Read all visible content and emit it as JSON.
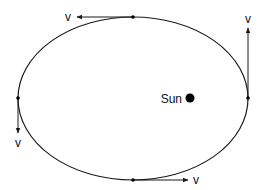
{
  "diagram": {
    "colors": {
      "stroke": "#1a1a1a",
      "background": "#ffffff",
      "sun": "#000000"
    },
    "orbit": {
      "cx": 133,
      "cy": 98.5,
      "rx": 115,
      "ry": 81.5
    },
    "sun": {
      "label": "Sun",
      "x": 190,
      "y": 98,
      "r": 4.5
    },
    "points": [
      {
        "name": "top",
        "x": 133,
        "y": 17,
        "arrow_to": [
          77,
          17
        ],
        "label": "v",
        "label_x": 68,
        "label_y": 21
      },
      {
        "name": "right",
        "x": 248,
        "y": 98,
        "arrow_to": [
          248,
          28
        ],
        "label": "v",
        "label_x": 248,
        "label_y": 23
      },
      {
        "name": "left",
        "x": 18,
        "y": 98,
        "arrow_to": [
          18,
          133
        ],
        "label": "v",
        "label_x": 18,
        "label_y": 147
      },
      {
        "name": "bottom",
        "x": 133,
        "y": 180,
        "arrow_to": [
          188,
          180
        ],
        "label": "v",
        "label_x": 196,
        "label_y": 184
      }
    ]
  }
}
